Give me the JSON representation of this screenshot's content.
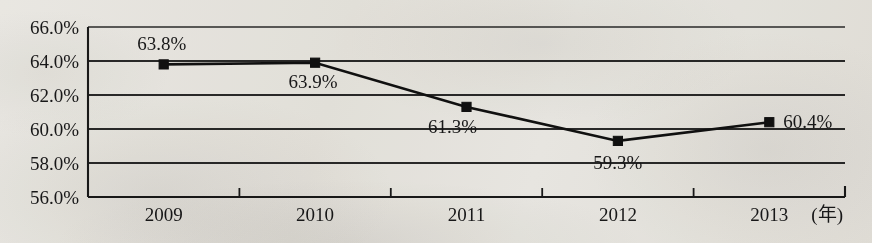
{
  "chart_data": {
    "type": "line",
    "title": "",
    "subtitle": "",
    "xlabel": "(年)",
    "ylabel": "",
    "categories": [
      "2009",
      "2010",
      "2011",
      "2012",
      "2013"
    ],
    "values": [
      63.8,
      63.9,
      61.3,
      59.3,
      60.4
    ],
    "point_labels": [
      "63.8%",
      "63.9%",
      "61.3%",
      "59.3%",
      "60.4%"
    ],
    "series": [
      {
        "name": "",
        "values": [
          63.8,
          63.9,
          61.3,
          59.3,
          60.4
        ],
        "marker": "square",
        "marker_color": "#111111",
        "line_color": "#111111"
      }
    ],
    "ylim": [
      56.0,
      66.0
    ],
    "ytick_values": [
      56.0,
      58.0,
      60.0,
      62.0,
      64.0,
      66.0
    ],
    "ytick_labels": [
      "56.0%",
      "58.0%",
      "60.0%",
      "62.0%",
      "64.0%",
      "66.0%"
    ],
    "xtick_labels": [
      "2009",
      "2010",
      "2011",
      "2012",
      "2013"
    ],
    "grid": true,
    "grid_axis": "y",
    "legend": false,
    "legend_position": "none",
    "axis_unit_label": "(年)",
    "colors": {
      "line": "#111111",
      "marker": "#111111",
      "grid": "#2b2b2b",
      "axis": "#1a1a1a",
      "text": "#19191a",
      "background": "#f2f1ee"
    }
  },
  "plot": {
    "frame": {
      "left": 88,
      "top": 27,
      "right": 845,
      "bottom": 197
    },
    "label_offsets": [
      {
        "dx": -2,
        "dy": -14,
        "anchor": "middle"
      },
      {
        "dx": -2,
        "dy": 25,
        "anchor": "middle"
      },
      {
        "dx": -14,
        "dy": 26,
        "anchor": "middle"
      },
      {
        "dx": 0,
        "dy": 28,
        "anchor": "middle"
      },
      {
        "dx": 14,
        "dy": 6,
        "anchor": "start"
      }
    ]
  }
}
